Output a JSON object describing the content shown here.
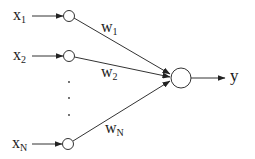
{
  "diagram": {
    "type": "perceptron",
    "colors": {
      "stroke": "#333333",
      "text": "#1a1a1a",
      "background": "#ffffff"
    },
    "inputs": [
      {
        "base": "x",
        "sub": "1",
        "weight_base": "w",
        "weight_sub": "1"
      },
      {
        "base": "x",
        "sub": "2",
        "weight_base": "w",
        "weight_sub": "2"
      },
      {
        "base": "x",
        "sub": "N",
        "weight_base": "w",
        "weight_sub": "N"
      }
    ],
    "ellipsis": ".",
    "output": {
      "label": "y"
    }
  }
}
